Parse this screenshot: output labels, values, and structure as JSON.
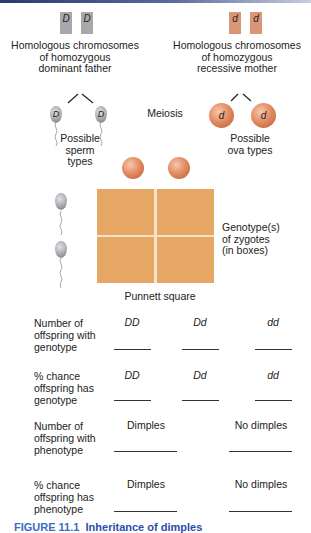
{
  "figure": {
    "caption_label": "FIGURE 11.1",
    "caption_title": "Inheritance of dimples",
    "colors": {
      "father_chromosome": "#a8a8ab",
      "mother_chromosome": "#d99676",
      "punnett_square": "#e7a764",
      "ovum": "#e38e64",
      "caption": "#2a4fa8"
    }
  },
  "father": {
    "chromosomes": [
      "D",
      "D"
    ],
    "label_lines": [
      "Homologous chromosomes",
      "of homozygous",
      "dominant father"
    ],
    "gametes": [
      "D",
      "D"
    ],
    "gamete_label_lines": [
      "Possible",
      "sperm",
      "types"
    ]
  },
  "mother": {
    "chromosomes": [
      "d",
      "d"
    ],
    "label_lines": [
      "Homologous chromosomes",
      "of homozygous",
      "recessive mother"
    ],
    "gametes": [
      "d",
      "d"
    ],
    "gamete_label_lines": [
      "Possible",
      "ova types"
    ]
  },
  "meiosis_label": "Meiosis",
  "punnett": {
    "title": "Punnett square",
    "side_label_lines": [
      "Genotype(s)",
      "of zygotes",
      "(in boxes)"
    ],
    "cells": [
      "",
      "",
      "",
      ""
    ]
  },
  "genotype_table": {
    "columns": [
      "DD",
      "Dd",
      "dd"
    ],
    "rows": [
      {
        "label_lines": [
          "Number of",
          "offspring with",
          "genotype"
        ],
        "values": [
          "",
          "",
          ""
        ]
      },
      {
        "label_lines": [
          "% chance",
          "offspring has",
          "genotype"
        ],
        "values": [
          "",
          "",
          ""
        ]
      }
    ]
  },
  "phenotype_table": {
    "columns": [
      "Dimples",
      "No dimples"
    ],
    "rows": [
      {
        "label_lines": [
          "Number of",
          "offspring with",
          "phenotype"
        ],
        "values": [
          "",
          ""
        ]
      },
      {
        "label_lines": [
          "% chance",
          "offspring has",
          "phenotype"
        ],
        "values": [
          "",
          ""
        ]
      }
    ]
  }
}
